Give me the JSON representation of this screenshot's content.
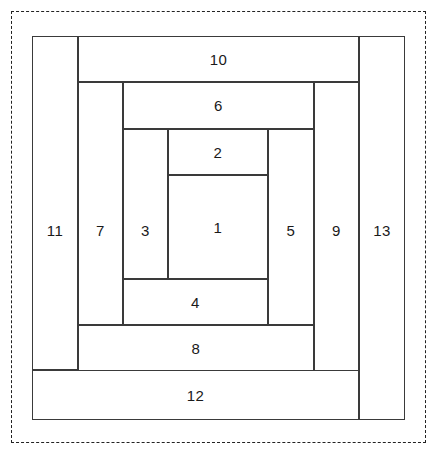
{
  "diagram": {
    "boundary": {
      "style": "dashed",
      "color": "#222222"
    },
    "block": {
      "outline_color": "#3a3a3a",
      "fill_color": "#ffffff",
      "label_color": "#1a1a1a"
    },
    "pieces": [
      {
        "id": "piece-1",
        "label": "1",
        "orientation": "center",
        "x": 136,
        "y": 139,
        "w": 100,
        "h": 104
      },
      {
        "id": "piece-2",
        "label": "2",
        "orientation": "horizontal",
        "x": 136,
        "y": 93,
        "w": 100,
        "h": 46
      },
      {
        "id": "piece-3",
        "label": "3",
        "orientation": "vertical",
        "x": 91,
        "y": 93,
        "w": 45,
        "h": 150
      },
      {
        "id": "piece-4",
        "label": "4",
        "orientation": "horizontal",
        "x": 91,
        "y": 243,
        "w": 145,
        "h": 46
      },
      {
        "id": "piece-5",
        "label": "5",
        "orientation": "vertical",
        "x": 236,
        "y": 93,
        "w": 46,
        "h": 196
      },
      {
        "id": "piece-6",
        "label": "6",
        "orientation": "horizontal",
        "x": 91,
        "y": 46,
        "w": 191,
        "h": 47
      },
      {
        "id": "piece-7",
        "label": "7",
        "orientation": "vertical",
        "x": 46,
        "y": 46,
        "w": 45,
        "h": 243
      },
      {
        "id": "piece-8",
        "label": "8",
        "orientation": "horizontal",
        "x": 46,
        "y": 289,
        "w": 236,
        "h": 47
      },
      {
        "id": "piece-9",
        "label": "9",
        "orientation": "vertical",
        "x": 282,
        "y": 46,
        "w": 45,
        "h": 290
      },
      {
        "id": "piece-10",
        "label": "10",
        "orientation": "horizontal",
        "x": 46,
        "y": 0,
        "w": 281,
        "h": 46
      },
      {
        "id": "piece-11",
        "label": "11",
        "orientation": "vertical",
        "x": 0,
        "y": 0,
        "w": 46,
        "h": 334
      },
      {
        "id": "piece-12",
        "label": "12",
        "orientation": "horizontal",
        "x": 0,
        "y": 334,
        "w": 327,
        "h": 50
      },
      {
        "id": "piece-13",
        "label": "13",
        "orientation": "vertical",
        "x": 327,
        "y": 0,
        "w": 46,
        "h": 384
      }
    ]
  }
}
